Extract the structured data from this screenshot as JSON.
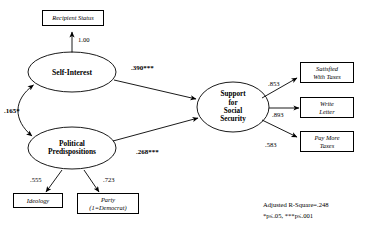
{
  "diagram": {
    "type": "path-analysis-structural-equation-model",
    "latent_variables": [
      {
        "id": "self-interest",
        "label": "Self-Interest"
      },
      {
        "id": "political-predispositions",
        "label": "Political\nPredispositions"
      },
      {
        "id": "support-social-security",
        "label": "Support\nfor\nSocial\nSecurity"
      }
    ],
    "observed_variables": [
      {
        "id": "recipient-status",
        "label": "Recipient Status"
      },
      {
        "id": "ideology",
        "label": "Ideology"
      },
      {
        "id": "party",
        "label": "Party\n(1=Democrat)"
      },
      {
        "id": "satisfied-with-taxes",
        "label": "Satisfied\nWith  Taxes"
      },
      {
        "id": "write-letter",
        "label": "Write\nLetter"
      },
      {
        "id": "pay-more-taxes",
        "label": "Pay  More\nTaxes"
      }
    ],
    "paths": [
      {
        "id": "self-interest-to-recipient-status",
        "from": "self-interest",
        "to": "recipient-status",
        "coefficient": "1.00"
      },
      {
        "id": "self-interest-to-support",
        "from": "self-interest",
        "to": "support-social-security",
        "coefficient": ".390***"
      },
      {
        "id": "predispositions-to-support",
        "from": "political-predispositions",
        "to": "support-social-security",
        "coefficient": ".268***"
      },
      {
        "id": "self-interest-predispositions-correlation",
        "from": "self-interest",
        "to": "political-predispositions",
        "coefficient": ".165*",
        "style": "double-headed-curved"
      },
      {
        "id": "predispositions-to-ideology",
        "from": "political-predispositions",
        "to": "ideology",
        "coefficient": ".555"
      },
      {
        "id": "predispositions-to-party",
        "from": "political-predispositions",
        "to": "party",
        "coefficient": ".723"
      },
      {
        "id": "support-to-satisfied-with-taxes",
        "from": "support-social-security",
        "to": "satisfied-with-taxes",
        "coefficient": ".853"
      },
      {
        "id": "support-to-write-letter",
        "from": "support-social-security",
        "to": "write-letter",
        "coefficient": ".893"
      },
      {
        "id": "support-to-pay-more-taxes",
        "from": "support-social-security",
        "to": "pay-more-taxes",
        "coefficient": ".583"
      }
    ],
    "statistics": {
      "adjusted_r_square": "Adjusted R-Square=.248",
      "significance_legend": "*p≤.05,  ***p≤.001"
    },
    "colors": {
      "stroke": "#000000",
      "background": "#ffffff"
    }
  }
}
